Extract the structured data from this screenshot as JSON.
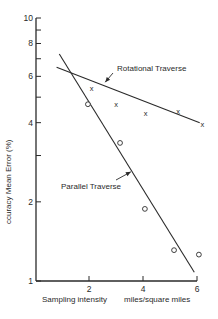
{
  "chart_data": {
    "type": "scatter",
    "title": "",
    "xlabel": "Sampling intensity",
    "xlabel_units": "miles/square miles",
    "ylabel": "ccuracy Mean Error  (%)",
    "y_scale": "log",
    "xlim": [
      0,
      6
    ],
    "ylim": [
      1,
      10
    ],
    "grid": false,
    "x_ticks": [
      2,
      4,
      6
    ],
    "y_ticks": [
      1,
      2,
      3,
      4,
      5,
      6,
      7,
      8,
      9,
      10
    ],
    "y_tick_labels": [
      "1",
      "2",
      "",
      "4",
      "",
      "6",
      "",
      "8",
      "",
      "10"
    ],
    "series": [
      {
        "name": "Rotational Traverse",
        "marker": "x",
        "points": [
          {
            "x": 2.1,
            "y": 5.4
          },
          {
            "x": 3.0,
            "y": 4.7
          },
          {
            "x": 4.1,
            "y": 4.35
          },
          {
            "x": 5.3,
            "y": 4.4
          },
          {
            "x": 6.2,
            "y": 3.95
          }
        ],
        "fit_line": {
          "x0": 0.8,
          "y0": 6.5,
          "x1": 6.1,
          "y1": 4.0
        },
        "annotation": {
          "text": "Rotational Traverse",
          "arrow_to": {
            "x": 2.6,
            "y": 5.7
          }
        }
      },
      {
        "name": "Parallel Traverse",
        "marker": "o",
        "points": [
          {
            "x": 1.96,
            "y": 4.7
          },
          {
            "x": 3.15,
            "y": 3.35
          },
          {
            "x": 4.07,
            "y": 1.88
          },
          {
            "x": 5.15,
            "y": 1.31
          },
          {
            "x": 6.07,
            "y": 1.26
          }
        ],
        "fit_line": {
          "x0": 0.9,
          "y0": 7.3,
          "x1": 5.9,
          "y1": 1.08
        },
        "annotation": {
          "text": "Parallel Traverse",
          "arrow_to": {
            "x": 3.55,
            "y": 2.6
          }
        }
      }
    ],
    "legend": "inline annotations with arrows"
  },
  "labels": {
    "rotational": "Rotational Traverse",
    "parallel": "Parallel Traverse",
    "xlabel": "Sampling intensity",
    "xunits": "miles/square miles",
    "ylabel": "ccuracy Mean Error  (%)"
  }
}
